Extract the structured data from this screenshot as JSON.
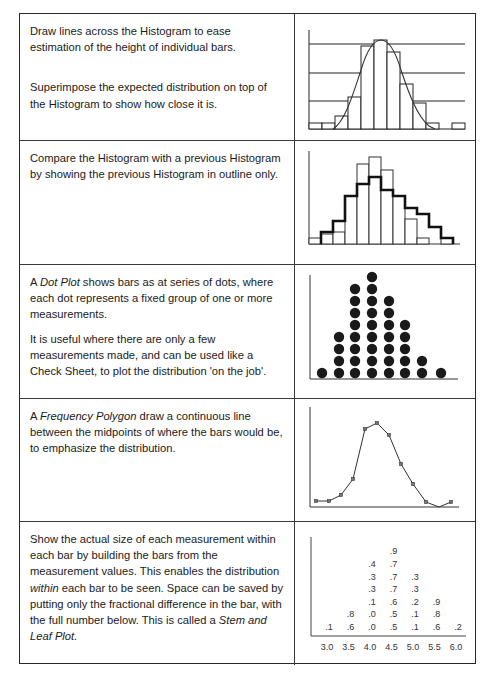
{
  "rows": [
    {
      "paragraphs": [
        "Draw lines across the Histogram to ease estimation of the height of individual bars.",
        "Superimpose the expected distribution on top of the Histogram to show how close it is."
      ]
    },
    {
      "paragraphs": [
        "Compare the Histogram with a previous Histogram by showing the previous Histogram in outline only."
      ]
    },
    {
      "p1_pre": "A ",
      "p1_em": "Dot Plot",
      "p1_post": " shows bars as at series of dots, where each dot represents a fixed group of one or more measurements.",
      "p2": "It is useful where there are only a few measurements made, and can be used like a Check Sheet, to plot  the distribution 'on the job'."
    },
    {
      "p1_pre": "A ",
      "p1_em": "Frequency Polygon",
      "p1_post": " draw a continuous line between the midpoints of where the bars would be, to emphasize the distribution."
    },
    {
      "p1_a": "Show the actual size of each measurement within each bar by building the bars from the measurement values. This enables the distribution ",
      "p1_em1": "within",
      "p1_b": " each bar to be seen. Space can be saved by putting only the fractional difference in the bar, with the full number below. This is called a ",
      "p1_em2": "Stem and Leaf Plot."
    }
  ],
  "chart_data": [
    {
      "type": "bar",
      "title": "Histogram with gridlines and expected distribution curve",
      "values": [
        1,
        1,
        2,
        5,
        10,
        11,
        9,
        6,
        4,
        1,
        0,
        1
      ],
      "gridlines": [
        3,
        6,
        9
      ],
      "overlay": "normal curve",
      "grid": true
    },
    {
      "type": "bar",
      "title": "Histogram compared with previous histogram (outline)",
      "series": [
        {
          "name": "current",
          "values": [
            1,
            2,
            3,
            8,
            13,
            14,
            12,
            8,
            6,
            1,
            0,
            1
          ]
        },
        {
          "name": "previous (outline)",
          "values": [
            0,
            3,
            4,
            8,
            10,
            11,
            9,
            8,
            6,
            5,
            3,
            1
          ]
        }
      ]
    },
    {
      "type": "scatter",
      "title": "Dot Plot",
      "categories": [
        1,
        2,
        3,
        4,
        5,
        6,
        7,
        8
      ],
      "values": [
        1,
        4,
        8,
        9,
        7,
        5,
        2,
        1
      ]
    },
    {
      "type": "line",
      "title": "Frequency Polygon",
      "values": [
        1,
        1,
        2,
        5,
        14,
        15,
        13,
        8,
        4,
        1,
        0,
        1
      ]
    },
    {
      "type": "table",
      "title": "Stem and Leaf Plot",
      "categories": [
        "3.0",
        "3.5",
        "4.0",
        "4.5",
        "5.0",
        "5.5",
        "6.0"
      ],
      "leaves": [
        [
          ".1"
        ],
        [
          ".6",
          ".8"
        ],
        [
          ".0",
          ".0",
          ".1",
          ".3",
          ".3",
          ".4"
        ],
        [
          ".5",
          ".5",
          ".6",
          ".7",
          ".7",
          ".7",
          ".9"
        ],
        [
          ".1",
          ".1",
          ".2",
          ".3",
          ".3"
        ],
        [
          ".6",
          ".8",
          ".9"
        ],
        [
          ".2"
        ]
      ]
    }
  ]
}
